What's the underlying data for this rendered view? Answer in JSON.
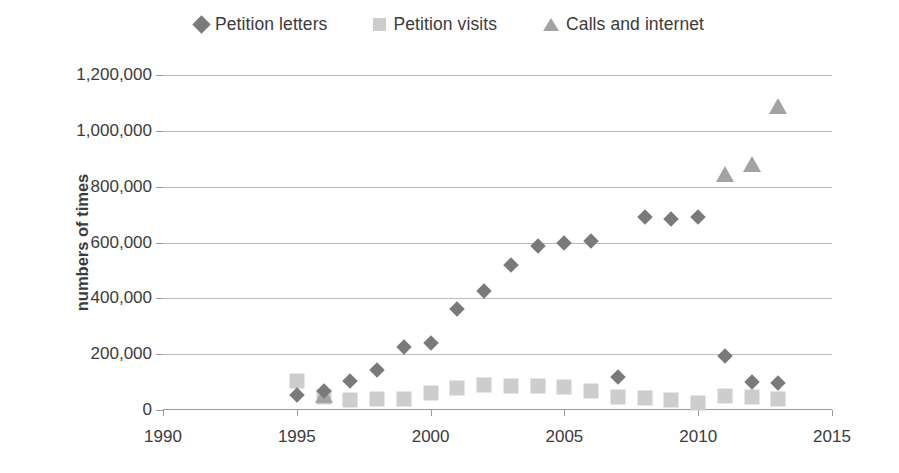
{
  "legend": {
    "position": "top-center",
    "entries": [
      {
        "label": "Petition letters",
        "marker": "diamond-icon",
        "color": "#7a7a7a"
      },
      {
        "label": "Petition visits",
        "marker": "square-icon",
        "color": "#cdcdcd"
      },
      {
        "label": "Calls and internet",
        "marker": "triangle-icon",
        "color": "#a3a3a3"
      }
    ]
  },
  "chart_data": {
    "type": "scatter",
    "title": "",
    "xlabel": "",
    "ylabel": "numbers of times",
    "xlim": [
      1990,
      2015
    ],
    "ylim": [
      0,
      1200000
    ],
    "xticks": [
      "1990",
      "1995",
      "2000",
      "2005",
      "2010",
      "2015"
    ],
    "xtick_values": [
      1990,
      1995,
      2000,
      2005,
      2010,
      2015
    ],
    "yticks": [
      "0",
      "200,000",
      "400,000",
      "600,000",
      "800,000",
      "1,000,000",
      "1,200,000"
    ],
    "ytick_values": [
      0,
      200000,
      400000,
      600000,
      800000,
      1000000,
      1200000
    ],
    "grid": "horizontal",
    "legend_position": "top-center",
    "series": [
      {
        "name": "Petition letters",
        "marker": "diamond",
        "color": "#7a7a7a",
        "x": [
          1995,
          1996,
          1997,
          1998,
          1999,
          2000,
          2001,
          2002,
          2003,
          2004,
          2005,
          2006,
          2007,
          2008,
          2009,
          2010,
          2011,
          2012,
          2013
        ],
        "values": [
          55000,
          68000,
          103000,
          143000,
          224000,
          241000,
          361000,
          428000,
          518000,
          588000,
          600000,
          607000,
          118000,
          693000,
          685000,
          690000,
          193000,
          100000,
          95000
        ]
      },
      {
        "name": "Petition visits",
        "marker": "square",
        "color": "#cdcdcd",
        "x": [
          1995,
          1996,
          1997,
          1998,
          1999,
          2000,
          2001,
          2002,
          2003,
          2004,
          2005,
          2006,
          2007,
          2008,
          2009,
          2010,
          2011,
          2012,
          2013
        ],
        "values": [
          105000,
          48000,
          35000,
          38000,
          40000,
          62000,
          80000,
          90000,
          85000,
          85000,
          84000,
          68000,
          45000,
          42000,
          36000,
          24000,
          50000,
          46000,
          40000
        ]
      },
      {
        "name": "Calls and internet",
        "marker": "triangle",
        "color": "#a3a3a3",
        "x": [
          1996,
          2011,
          2012,
          2013
        ],
        "values": [
          52000,
          845000,
          880000,
          1090000
        ]
      }
    ]
  }
}
